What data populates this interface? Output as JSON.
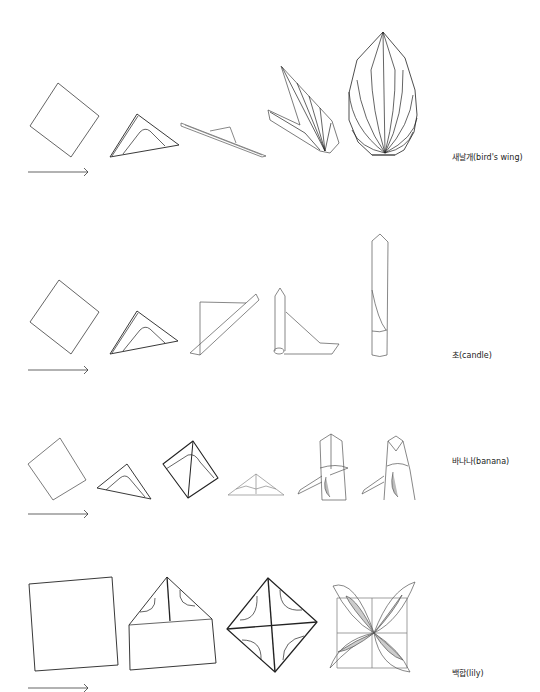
{
  "rows": [
    {
      "name": "birds-wing",
      "label": "새날개(bird's wing)",
      "steps": 5
    },
    {
      "name": "candle",
      "label": "초(candle)",
      "steps": 5
    },
    {
      "name": "banana",
      "label": "바나나(banana)",
      "steps": 6
    },
    {
      "name": "lily",
      "label": "백합(lily)",
      "steps": 4
    }
  ],
  "colors": {
    "line": "#222222",
    "light_line": "#777777",
    "fill": "#cccccc",
    "bg": "#ffffff"
  }
}
